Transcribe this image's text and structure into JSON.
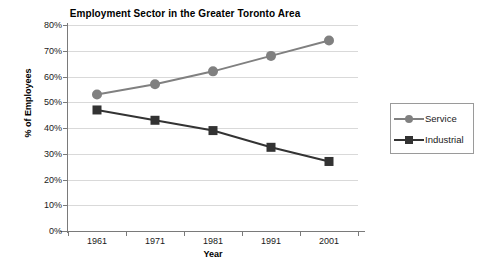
{
  "chart_data": {
    "type": "line",
    "title": "Employment Sector in the Greater Toronto Area",
    "xlabel": "Year",
    "ylabel": "% of Employees",
    "categories": [
      "1961",
      "1971",
      "1981",
      "1991",
      "2001"
    ],
    "ytick_labels": [
      "0%",
      "10%",
      "20%",
      "30%",
      "40%",
      "50%",
      "60%",
      "70%",
      "80%"
    ],
    "ytick_values": [
      0,
      10,
      20,
      30,
      40,
      50,
      60,
      70,
      80
    ],
    "ylim": [
      0,
      80
    ],
    "grid": "horizontal",
    "legend_position": "right",
    "series": [
      {
        "name": "Service",
        "marker": "circle",
        "color": "#808080",
        "values": [
          53,
          57,
          62,
          68,
          74
        ]
      },
      {
        "name": "Industrial",
        "marker": "square",
        "color": "#333333",
        "values": [
          47,
          43,
          39,
          32.5,
          27
        ]
      }
    ]
  },
  "colors": {
    "service": "#808080",
    "industrial": "#333333",
    "gridline": "#d9d9d9",
    "axis": "#7a7a7a",
    "background": "#ffffff",
    "text": "#1a1a1a"
  }
}
